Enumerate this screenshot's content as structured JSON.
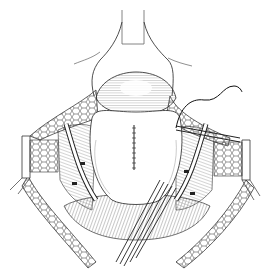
{
  "figure": {
    "type": "surgical line illustration",
    "colors": {
      "background": "#ffffff",
      "ink": "#1a1a1a",
      "shade": "#6e6e6e",
      "light_shade": "#b5b5b5"
    },
    "elements": [
      {
        "name": "top-retractor-blade",
        "label": "Retractor blade (top)"
      },
      {
        "name": "left-retractor-blade",
        "label": "Retractor blade (left)"
      },
      {
        "name": "right-retractor-blade",
        "label": "Retractor blade (right)"
      },
      {
        "name": "central-organ",
        "label": "Organ with sutured midline incision"
      },
      {
        "name": "suture-line",
        "label": "Running suture"
      },
      {
        "name": "suture-thread",
        "label": "Free suture thread (upper right)"
      },
      {
        "name": "instrument-bundle",
        "label": "Instruments (lower center)"
      },
      {
        "name": "right-forceps",
        "label": "Forceps (right)"
      },
      {
        "name": "tissue-layers",
        "label": "Retracted fat/tissue layers"
      }
    ]
  }
}
